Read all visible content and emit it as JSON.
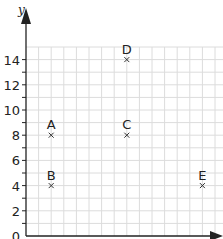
{
  "chart_data": {
    "type": "scatter",
    "title": "",
    "xlabel": "",
    "ylabel": "y",
    "y_ticks": [
      "0",
      "2",
      "4",
      "6",
      "8",
      "10",
      "12",
      "14"
    ],
    "xlim": [
      0,
      15
    ],
    "ylim": [
      0,
      15
    ],
    "grid": true,
    "points": [
      {
        "label": "A",
        "x": 2,
        "y": 8
      },
      {
        "label": "B",
        "x": 2,
        "y": 4
      },
      {
        "label": "C",
        "x": 8,
        "y": 8
      },
      {
        "label": "D",
        "x": 8,
        "y": 14
      },
      {
        "label": "E",
        "x": 14,
        "y": 4
      }
    ],
    "marker": "x",
    "colors": {
      "grid": "#dcdcdc",
      "axis": "#222222",
      "text": "#222222"
    }
  }
}
